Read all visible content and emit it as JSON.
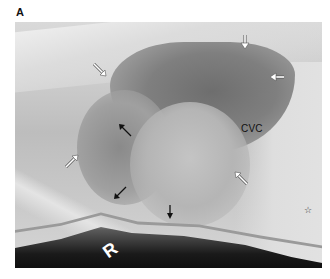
{
  "figure": {
    "panel_label": "A",
    "image_type": "lateral thoracic radiograph",
    "labels": {
      "cvc": "CVC",
      "marker": "R",
      "star": "☆"
    },
    "annotations": [
      {
        "type": "white-arrow",
        "x": 100,
        "y": 70,
        "direction": "down-right"
      },
      {
        "type": "white-arrow",
        "x": 245,
        "y": 42,
        "direction": "down"
      },
      {
        "type": "white-arrow",
        "x": 276,
        "y": 77,
        "direction": "left"
      },
      {
        "type": "white-arrow",
        "x": 72,
        "y": 160,
        "direction": "up-right"
      },
      {
        "type": "white-arrow",
        "x": 240,
        "y": 178,
        "direction": "up-left"
      },
      {
        "type": "black-arrow",
        "x": 125,
        "y": 129,
        "direction": "up-left"
      },
      {
        "type": "black-arrow",
        "x": 118,
        "y": 193,
        "direction": "down-left"
      },
      {
        "type": "black-arrow",
        "x": 170,
        "y": 215,
        "direction": "down"
      }
    ]
  }
}
